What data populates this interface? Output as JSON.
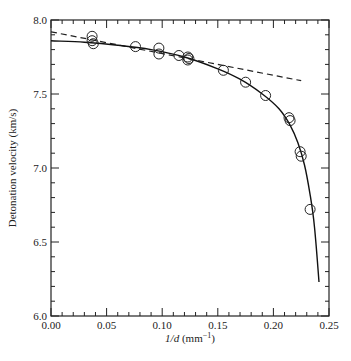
{
  "chart_data": {
    "type": "scatter",
    "title": "",
    "xlabel": "1/d (mm⁻¹)",
    "xlabel_parts": {
      "var": "1/d",
      "unit_open": " (mm",
      "unit_sup": "−1",
      "unit_close": ")"
    },
    "ylabel": "Detonation velocity (km/s)",
    "xlim": [
      0.0,
      0.25
    ],
    "ylim": [
      6.0,
      8.0
    ],
    "grid": false,
    "legend": null,
    "x_ticks": [
      "0.00",
      "0.05",
      "0.10",
      "0.15",
      "0.20",
      "0.25"
    ],
    "y_ticks": [
      "6.0",
      "6.5",
      "7.0",
      "7.5",
      "8.0"
    ],
    "series": [
      {
        "name": "measured",
        "style": "open-circle",
        "points": [
          [
            0.037,
            7.89
          ],
          [
            0.037,
            7.86
          ],
          [
            0.038,
            7.84
          ],
          [
            0.076,
            7.82
          ],
          [
            0.097,
            7.81
          ],
          [
            0.097,
            7.77
          ],
          [
            0.115,
            7.76
          ],
          [
            0.123,
            7.75
          ],
          [
            0.124,
            7.74
          ],
          [
            0.123,
            7.73
          ],
          [
            0.155,
            7.66
          ],
          [
            0.175,
            7.58
          ],
          [
            0.193,
            7.49
          ],
          [
            0.214,
            7.34
          ],
          [
            0.215,
            7.32
          ],
          [
            0.224,
            7.11
          ],
          [
            0.225,
            7.08
          ],
          [
            0.233,
            6.72
          ]
        ]
      },
      {
        "name": "fit curve",
        "style": "solid-line",
        "points": [
          [
            0.0,
            7.86
          ],
          [
            0.03,
            7.85
          ],
          [
            0.06,
            7.83
          ],
          [
            0.09,
            7.8
          ],
          [
            0.12,
            7.75
          ],
          [
            0.15,
            7.67
          ],
          [
            0.17,
            7.6
          ],
          [
            0.19,
            7.5
          ],
          [
            0.205,
            7.4
          ],
          [
            0.215,
            7.29
          ],
          [
            0.222,
            7.17
          ],
          [
            0.228,
            7.02
          ],
          [
            0.233,
            6.82
          ],
          [
            0.237,
            6.6
          ],
          [
            0.241,
            6.23
          ]
        ]
      },
      {
        "name": "linear extrapolation",
        "style": "dashed-line",
        "points": [
          [
            0.0,
            7.92
          ],
          [
            0.225,
            7.59
          ]
        ]
      }
    ]
  }
}
